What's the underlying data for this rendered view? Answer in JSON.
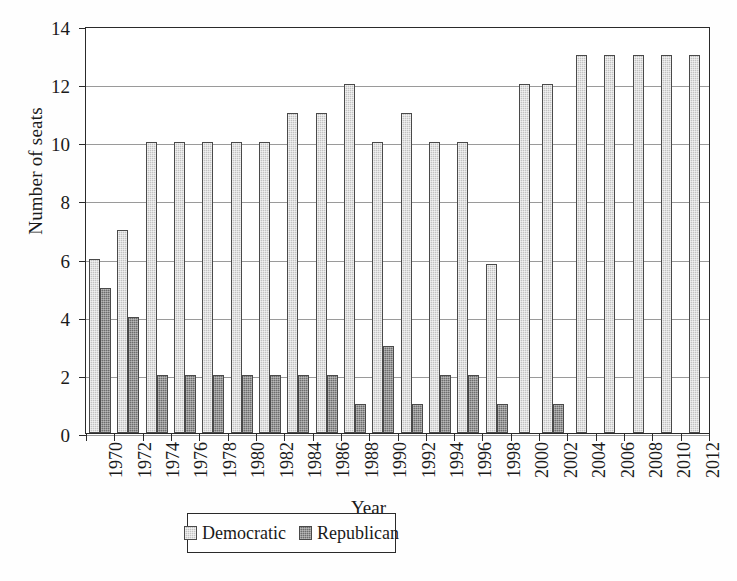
{
  "chart_data": {
    "type": "bar",
    "title": "",
    "xlabel": "Year",
    "ylabel": "Number of seats",
    "ylim": [
      0,
      14
    ],
    "ytick_values": [
      0,
      2,
      4,
      6,
      8,
      10,
      12,
      14
    ],
    "ytick_labels": [
      "0",
      "2",
      "4",
      "6",
      "8",
      "10",
      "12",
      "14"
    ],
    "grid": "horizontal",
    "legend_position": "bottom-center",
    "categories": [
      "1970",
      "1972",
      "1974",
      "1976",
      "1978",
      "1980",
      "1982",
      "1984",
      "1986",
      "1988",
      "1990",
      "1992",
      "1994",
      "1996",
      "1998",
      "2000",
      "2002",
      "2004",
      "2006",
      "2008",
      "2010",
      "2012"
    ],
    "series": [
      {
        "name": "Democratic",
        "color": "#c2c2c2",
        "values": [
          6,
          7,
          10,
          10,
          10,
          10,
          10,
          11,
          11,
          12,
          10,
          11,
          10,
          10,
          5.8,
          12,
          12,
          13,
          13,
          13,
          13,
          13
        ]
      },
      {
        "name": "Republican",
        "color": "#6d6d6d",
        "values": [
          5,
          4,
          2,
          2,
          2,
          2,
          2,
          2,
          2,
          1,
          3,
          1,
          2,
          2,
          1,
          0,
          1,
          0,
          0,
          0,
          0,
          0
        ]
      }
    ]
  },
  "legend": {
    "entries": [
      {
        "label": "Democratic",
        "swatch": "dem"
      },
      {
        "label": "Republican",
        "swatch": "rep"
      }
    ]
  }
}
